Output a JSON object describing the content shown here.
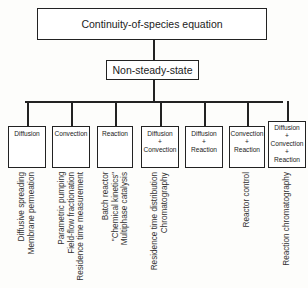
{
  "diagram": {
    "root": "Continuity-of-species equation",
    "level1": "Non-steady-state",
    "categories": [
      {
        "lines": [
          "Diffusion"
        ],
        "applications": [
          "Diffusive spreading",
          "Membrane permeation"
        ]
      },
      {
        "lines": [
          "Convection"
        ],
        "applications": [
          "Parametric pumping",
          "Field-flow fractionation",
          "Residence time measurement"
        ]
      },
      {
        "lines": [
          "Reaction"
        ],
        "applications": [
          "Batch reactor",
          "\"Chemical kinetics\"",
          "Multiphase catalysis"
        ]
      },
      {
        "lines": [
          "Diffusion",
          "+",
          "Convection"
        ],
        "applications": [
          "Residence time distribution",
          "Chromatography"
        ]
      },
      {
        "lines": [
          "Diffusion",
          "+",
          "Reaction"
        ],
        "applications": []
      },
      {
        "lines": [
          "Convection",
          "+",
          "Reaction"
        ],
        "applications": [
          "Reactor control"
        ]
      },
      {
        "lines": [
          "Diffusion",
          "+",
          "Convection",
          "+",
          "Reaction"
        ],
        "applications": [
          "Reaction chromatography"
        ]
      }
    ]
  }
}
